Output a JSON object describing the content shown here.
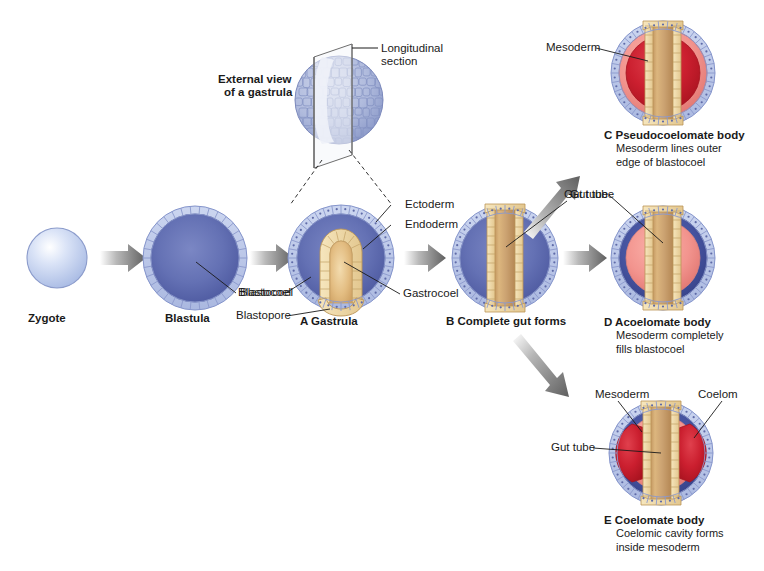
{
  "figure": {
    "type": "biological-process-diagram"
  },
  "stages": {
    "zygote": {
      "label": "Zygote"
    },
    "blastula": {
      "label": "Blastula",
      "annotations": [
        {
          "name": "blastocoel",
          "text": "Blastocoel"
        }
      ]
    },
    "external_view": {
      "label_line1": "External view",
      "label_line2": "of a gastrula",
      "callout_line1": "Longitudinal",
      "callout_line2": "section"
    },
    "gastrula": {
      "label": "A Gastrula",
      "annotations": [
        {
          "name": "ectoderm",
          "text": "Ectoderm"
        },
        {
          "name": "endoderm",
          "text": "Endoderm"
        },
        {
          "name": "blastocoel",
          "text": "Blastocoel"
        },
        {
          "name": "blastopore",
          "text": "Blastopore"
        },
        {
          "name": "gastrocoel",
          "text": "Gastrocoel"
        }
      ]
    },
    "complete_gut": {
      "label": "B Complete gut forms",
      "annotations": [
        {
          "name": "gut-tube",
          "text": "Gut tube"
        }
      ]
    },
    "pseudocoelomate": {
      "title": "C Pseudocoelomate body",
      "sub_line1": "Mesoderm lines outer",
      "sub_line2": "edge of blastocoel",
      "annotations": [
        {
          "name": "mesoderm",
          "text": "Mesoderm"
        }
      ]
    },
    "acoelomate": {
      "title": "D Acoelomate body",
      "sub_line1": "Mesoderm completely",
      "sub_line2": "fills blastocoel",
      "annotations": [
        {
          "name": "gut-tube",
          "text": "Gut tube"
        }
      ]
    },
    "coelomate": {
      "title": "E Coelomate body",
      "sub_line1": "Coelomic cavity forms",
      "sub_line2": "inside mesoderm",
      "annotations": [
        {
          "name": "mesoderm",
          "text": "Mesoderm"
        },
        {
          "name": "coelom",
          "text": "Coelom"
        },
        {
          "name": "gut-tube",
          "text": "Gut tube"
        }
      ]
    }
  },
  "colors": {
    "ectoderm_cell": "#b8c4e8",
    "ectoderm_cell_edge": "#7f8dc4",
    "blastocoel_blue": "#5160a8",
    "blastocoel_blue_dark": "#3d4d96",
    "endoderm_tan": "#edd9a8",
    "endoderm_tan_edge": "#c6a15e",
    "gut_tube_fill": "#c69a63",
    "mesoderm_pink": "#f2948e",
    "mesoderm_red": "#cf2030",
    "coelom_red": "#c41e2e",
    "arrow_gray": "#6e6e6e",
    "leader_line": "#1a1a1a",
    "background": "#ffffff",
    "zygote_blue": "#c3d0ef"
  }
}
